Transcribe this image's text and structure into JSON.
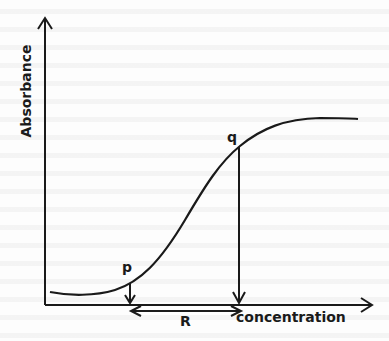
{
  "diagram": {
    "y_axis_label": "Absorbance",
    "x_axis_label": "concentration",
    "points": {
      "p": "p",
      "q": "q"
    },
    "range_label": "R",
    "curve_shape": "sigmoid",
    "line_color": "#1a1a1a",
    "background_color": "#fdfdfd"
  }
}
